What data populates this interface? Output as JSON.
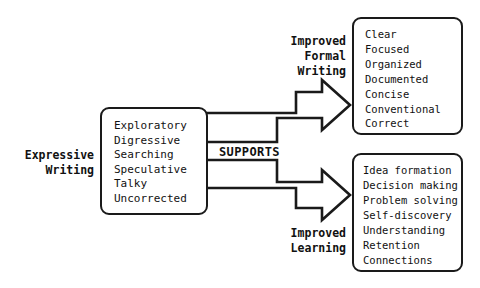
{
  "diagram": {
    "stroke_color": "#1a1a1a",
    "background_color": "#ffffff",
    "text_color": "#111111"
  },
  "source_box": {
    "label": "Expressive\nWriting",
    "items": [
      "Exploratory",
      "Digressive",
      "Searching",
      "Speculative",
      "Talky",
      "Uncorrected"
    ]
  },
  "connector": {
    "label": "SUPPORTS"
  },
  "targets": [
    {
      "label": "Improved\nFormal\nWriting",
      "items": [
        "Clear",
        "Focused",
        "Organized",
        "Documented",
        "Concise",
        "Conventional",
        "Correct"
      ]
    },
    {
      "label": "Improved\nLearning",
      "items": [
        "Idea formation",
        "Decision making",
        "Problem solving",
        "Self-discovery",
        "Understanding",
        "Retention",
        "Connections"
      ]
    }
  ]
}
